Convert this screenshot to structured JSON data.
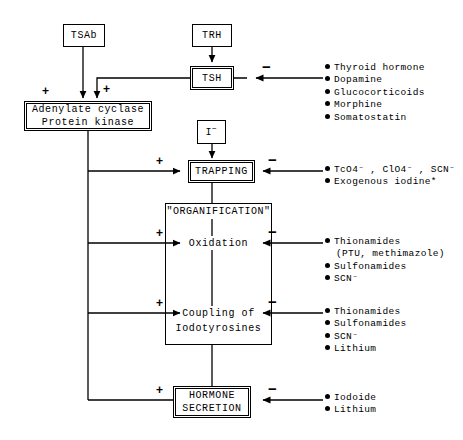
{
  "diagram": {
    "nodes": {
      "tsab": "TSAb",
      "trh": "TRH",
      "tsh": "TSH",
      "iodide": "I",
      "iodide_charge": "−",
      "adenylate_line1": "Adenylate cyclase",
      "adenylate_line2": "Protein kinase",
      "trapping": "TRAPPING",
      "organification": "\"ORGANIFICATION\"",
      "oxidation": "Oxidation",
      "coupling_line1": "Coupling of",
      "coupling_line2": "Iodotyrosines",
      "secretion_line1": "HORMONE",
      "secretion_line2": "SECRETION"
    },
    "signs": {
      "plus": "+",
      "minus": "−"
    },
    "inhibitors": {
      "tsh": [
        "Thyroid hormone",
        "Dopamine",
        "Glucocorticoids",
        "Morphine",
        "Somatostatin"
      ],
      "trapping": [
        "TcO4⁻ , ClO4⁻ , SCN⁻",
        "Exogenous iodine*"
      ],
      "oxidation": [
        "Thionamides",
        "(PTU, methimazole)",
        "Sulfonamides",
        "SCN⁻"
      ],
      "coupling": [
        "Thionamides",
        "Sulfonamides",
        "SCN⁻",
        "Lithium"
      ],
      "secretion": [
        "Iodoide",
        "Lithium"
      ]
    }
  }
}
